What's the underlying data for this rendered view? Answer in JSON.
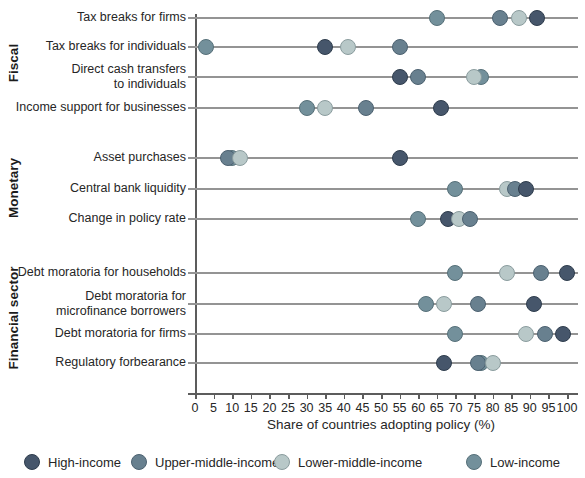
{
  "figure": {
    "xlabel": "Share of countries adopting policy (%)"
  },
  "legend": {
    "items": [
      {
        "id": "high",
        "label": "High-income",
        "fill": "#46566b",
        "stroke": "#2f3d4d"
      },
      {
        "id": "upper",
        "label": "Upper-middle-income",
        "fill": "#68808f",
        "stroke": "#4c6170"
      },
      {
        "id": "lower",
        "label": "Lower-middle-income",
        "fill": "#b8c8c8",
        "stroke": "#8a9c9e"
      },
      {
        "id": "low",
        "label": "Low-income",
        "fill": "#73909b",
        "stroke": "#567079"
      }
    ]
  },
  "chart_data": {
    "type": "scatter",
    "subtype": "dot-plot",
    "xlabel": "Share of countries adopting policy (%)",
    "xlim": [
      0,
      100
    ],
    "x_ticks": [
      0,
      5,
      10,
      15,
      20,
      25,
      30,
      35,
      40,
      45,
      50,
      55,
      60,
      65,
      70,
      75,
      80,
      85,
      90,
      95,
      100
    ],
    "legend_entries": [
      "High-income",
      "Upper-middle-income",
      "Lower-middle-income",
      "Low-income"
    ],
    "legend_position": "bottom",
    "grid": "horizontal-row-lines",
    "sections": [
      {
        "label": "Fiscal",
        "rows": [
          {
            "label": "Tax breaks for firms",
            "values": {
              "high": 92,
              "upper": 82,
              "lower": 87,
              "low": 65
            },
            "dots": [
              {
                "group": "low",
                "value": 65
              },
              {
                "group": "upper",
                "value": 82
              },
              {
                "group": "lower",
                "value": 87
              },
              {
                "group": "high",
                "value": 92
              }
            ]
          },
          {
            "label": "Tax breaks for individuals",
            "values": {
              "high": 35,
              "upper": 55,
              "lower": 41,
              "low": 3
            },
            "dots": [
              {
                "group": "low",
                "value": 3
              },
              {
                "group": "high",
                "value": 35
              },
              {
                "group": "lower",
                "value": 41
              },
              {
                "group": "upper",
                "value": 55
              }
            ]
          },
          {
            "label": "Direct cash transfers\nto individuals",
            "values": {
              "high": 55,
              "upper": 60,
              "lower": 75,
              "low": 77
            },
            "dots": [
              {
                "group": "high",
                "value": 55
              },
              {
                "group": "upper",
                "value": 60
              },
              {
                "group": "low",
                "value": 77
              },
              {
                "group": "lower",
                "value": 75
              }
            ]
          },
          {
            "label": "Income support for businesses",
            "values": {
              "high": 66,
              "upper": 46,
              "lower": 35,
              "low": 30
            },
            "dots": [
              {
                "group": "low",
                "value": 30
              },
              {
                "group": "lower",
                "value": 35
              },
              {
                "group": "upper",
                "value": 46
              },
              {
                "group": "high",
                "value": 66
              }
            ]
          }
        ]
      },
      {
        "label": "Monetary",
        "rows": [
          {
            "label": "Asset purchases",
            "values": {
              "high": 55,
              "upper": 9,
              "lower": 12,
              "low": 10
            },
            "dots": [
              {
                "group": "low",
                "value": 10
              },
              {
                "group": "upper",
                "value": 9
              },
              {
                "group": "lower",
                "value": 12
              },
              {
                "group": "high",
                "value": 55
              }
            ]
          },
          {
            "label": "Central bank liquidity",
            "values": {
              "high": 89,
              "upper": 86,
              "lower": 84,
              "low": 70
            },
            "dots": [
              {
                "group": "low",
                "value": 70
              },
              {
                "group": "lower",
                "value": 84
              },
              {
                "group": "upper",
                "value": 86
              },
              {
                "group": "high",
                "value": 89
              }
            ]
          },
          {
            "label": "Change in policy rate",
            "values": {
              "high": 68,
              "upper": 74,
              "lower": 71,
              "low": 60
            },
            "dots": [
              {
                "group": "low",
                "value": 60
              },
              {
                "group": "high",
                "value": 68
              },
              {
                "group": "lower",
                "value": 71
              },
              {
                "group": "upper",
                "value": 74
              }
            ]
          }
        ]
      },
      {
        "label": "Financial sector",
        "rows": [
          {
            "label": "Debt moratoria for households",
            "values": {
              "high": 100,
              "upper": 93,
              "lower": 84,
              "low": 70
            },
            "dots": [
              {
                "group": "low",
                "value": 70
              },
              {
                "group": "lower",
                "value": 84
              },
              {
                "group": "upper",
                "value": 93
              },
              {
                "group": "high",
                "value": 100
              }
            ]
          },
          {
            "label": "Debt moratoria for\nmicrofinance borrowers",
            "values": {
              "high": 91,
              "upper": 76,
              "lower": 67,
              "low": 62
            },
            "dots": [
              {
                "group": "low",
                "value": 62
              },
              {
                "group": "lower",
                "value": 67
              },
              {
                "group": "upper",
                "value": 76
              },
              {
                "group": "high",
                "value": 91
              }
            ]
          },
          {
            "label": "Debt moratoria for firms",
            "values": {
              "high": 99,
              "upper": 94,
              "lower": 89,
              "low": 70
            },
            "dots": [
              {
                "group": "low",
                "value": 70
              },
              {
                "group": "lower",
                "value": 89
              },
              {
                "group": "upper",
                "value": 94
              },
              {
                "group": "high",
                "value": 99
              }
            ]
          },
          {
            "label": "Regulatory forbearance",
            "values": {
              "high": 67,
              "upper": 76,
              "lower": 80,
              "low": 77
            },
            "dots": [
              {
                "group": "low",
                "value": 77
              },
              {
                "group": "upper",
                "value": 76
              },
              {
                "group": "lower",
                "value": 80
              },
              {
                "group": "high",
                "value": 67
              }
            ]
          }
        ]
      }
    ]
  }
}
